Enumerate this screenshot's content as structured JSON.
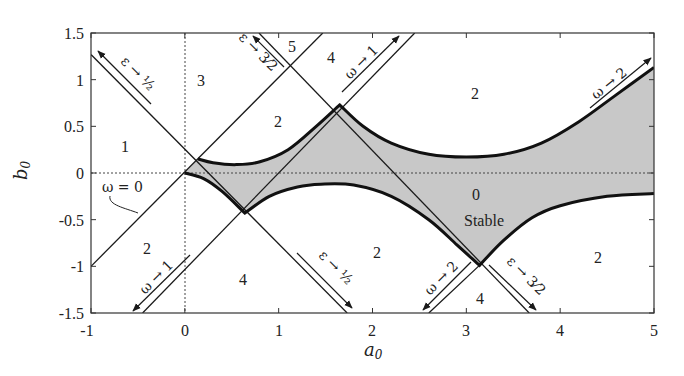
{
  "figure": {
    "xlabel": "a0",
    "xlabel_base": "a",
    "xlabel_sub": "0",
    "ylabel_base": "b",
    "ylabel_sub": "0",
    "xlim": [
      -1,
      5
    ],
    "ylim": [
      -1.5,
      1.5
    ],
    "xticks": [
      "-1",
      "0",
      "1",
      "2",
      "3",
      "4",
      "5"
    ],
    "yticks": [
      "1.5",
      "1",
      "0.5",
      "0",
      "-0.5",
      "-1",
      "-1.5"
    ],
    "colors": {
      "shade": "#c8c8c8",
      "line": "#1a1a1a",
      "frame": "#333333"
    }
  },
  "chart_data": {
    "type": "area",
    "title": "",
    "xlabel": "a0",
    "ylabel": "b0",
    "xlim": [
      -1,
      5
    ],
    "ylim": [
      -1.5,
      1.5
    ],
    "grid": false,
    "reference_lines": [
      "a0 = 0 (dotted)",
      "b0 = 0 (dotted)"
    ],
    "stable_region": {
      "label": "0 Stable",
      "upper_boundary": [
        [
          0.14,
          0.15
        ],
        [
          0.3,
          0.11
        ],
        [
          0.55,
          0.09
        ],
        [
          0.8,
          0.12
        ],
        [
          1.1,
          0.25
        ],
        [
          1.4,
          0.5
        ],
        [
          1.65,
          0.73
        ],
        [
          1.9,
          0.5
        ],
        [
          2.2,
          0.32
        ],
        [
          2.6,
          0.2
        ],
        [
          3.0,
          0.17
        ],
        [
          3.4,
          0.2
        ],
        [
          3.8,
          0.32
        ],
        [
          4.2,
          0.55
        ],
        [
          4.6,
          0.84
        ],
        [
          5.0,
          1.13
        ]
      ],
      "lower_boundary": [
        [
          0.0,
          0.0
        ],
        [
          0.2,
          -0.06
        ],
        [
          0.4,
          -0.2
        ],
        [
          0.64,
          -0.43
        ],
        [
          0.9,
          -0.25
        ],
        [
          1.2,
          -0.15
        ],
        [
          1.45,
          -0.12
        ],
        [
          1.8,
          -0.13
        ],
        [
          2.2,
          -0.25
        ],
        [
          2.6,
          -0.5
        ],
        [
          2.9,
          -0.77
        ],
        [
          3.14,
          -0.99
        ],
        [
          3.4,
          -0.72
        ],
        [
          3.7,
          -0.48
        ],
        [
          4.0,
          -0.35
        ],
        [
          4.5,
          -0.25
        ],
        [
          5.0,
          -0.22
        ]
      ]
    },
    "lines": [
      {
        "name": "omega = 0",
        "points": [
          [
            -1,
            -1
          ],
          [
            1.47,
            1.5
          ]
        ]
      },
      {
        "name": "descending line A",
        "points": [
          [
            -1,
            1.27
          ],
          [
            1.73,
            -1.5
          ]
        ]
      },
      {
        "name": "descending line B",
        "points": [
          [
            0.79,
            1.5
          ],
          [
            3.67,
            -1.5
          ]
        ]
      },
      {
        "name": "ascending line omega->1",
        "points": [
          [
            -0.45,
            -1.5
          ],
          [
            2.45,
            1.5
          ]
        ]
      },
      {
        "name": "ascending line omega->2",
        "points": [
          [
            2.6,
            -1.5
          ],
          [
            3.14,
            -0.99
          ]
        ]
      }
    ],
    "cusps": [
      [
        0.0,
        0.0
      ],
      [
        0.14,
        0.15
      ],
      [
        0.64,
        -0.43
      ],
      [
        1.65,
        0.73
      ],
      [
        3.14,
        -0.99
      ]
    ],
    "region_labels": [
      {
        "text": "1",
        "x": -0.6,
        "y": 0.5
      },
      {
        "text": "3",
        "x": 0.17,
        "y": 1.0
      },
      {
        "text": "5",
        "x": 1.15,
        "y": 1.35
      },
      {
        "text": "4",
        "x": 1.6,
        "y": 1.27
      },
      {
        "text": "2",
        "x": 0.95,
        "y": 0.55
      },
      {
        "text": "2",
        "x": 3.1,
        "y": 0.85
      },
      {
        "text": "2",
        "x": -0.4,
        "y": -0.68
      },
      {
        "text": "4",
        "x": 0.6,
        "y": -1.17
      },
      {
        "text": "2",
        "x": 2.05,
        "y": -0.85
      },
      {
        "text": "4",
        "x": 3.1,
        "y": -1.38
      },
      {
        "text": "2",
        "x": 4.55,
        "y": -0.85
      },
      {
        "text": "0",
        "x": 3.15,
        "y": -0.12
      },
      {
        "text": "Stable",
        "x": 3.15,
        "y": -0.42
      }
    ],
    "annotations": [
      "omega = 0",
      "epsilon -> 1/2 (upper-left, arrow up-left)",
      "epsilon -> 3/2 (top, arrow up-left)",
      "omega -> 1 (top, arrow up-right)",
      "omega -> 2 (right, arrow up-right)",
      "omega -> 1 (bottom-left, arrow down-left)",
      "epsilon -> 1/2 (bottom, arrow down-right)",
      "omega -> 2 (bottom, arrow down-left)",
      "epsilon -> 3/2 (bottom-right, arrow down-right)"
    ]
  },
  "labels": {
    "omega_zero": "ω = 0",
    "omega_to_1": "ω → 1",
    "omega_to_2": "ω → 2",
    "eps_to_half": "ε → ½",
    "eps_to_3half": "ε → 3⁄2",
    "stable_zero": "0",
    "stable_word": "Stable",
    "r1": "1",
    "r3": "3",
    "r5": "5",
    "r4a": "4",
    "r2a": "2",
    "r2b": "2",
    "r2c": "2",
    "r4b": "4",
    "r2d": "2",
    "r4c": "4",
    "r2e": "2"
  }
}
